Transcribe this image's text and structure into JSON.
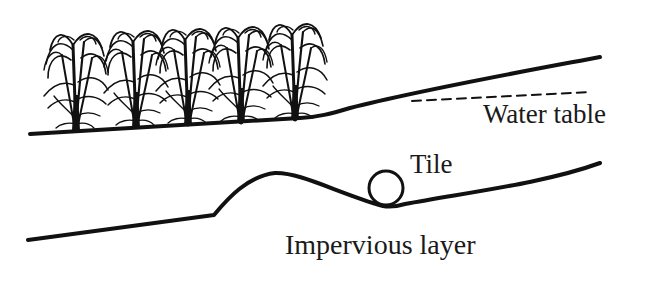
{
  "diagram": {
    "labels": {
      "water_table": "Water table",
      "tile": "Tile",
      "impervious_layer": "Impervious layer"
    },
    "elements": {
      "crop_plants_count": 5,
      "ground_surface": "solid sloped line",
      "water_table_line": "dashed line",
      "tile_drain": "circle on impervious layer",
      "impervious_layer": "solid line with ridge"
    },
    "colors": {
      "ink": "#111111",
      "background": "#ffffff"
    }
  }
}
